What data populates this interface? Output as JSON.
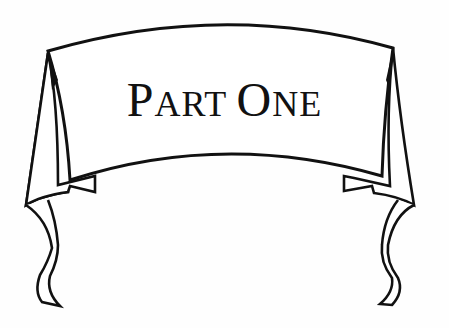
{
  "banner": {
    "title": "PART ONE",
    "title_parts": [
      {
        "text": "P",
        "size": "big"
      },
      {
        "text": "ART",
        "size": "small"
      },
      {
        "text": " ",
        "size": "small"
      },
      {
        "text": "O",
        "size": "big"
      },
      {
        "text": "NE",
        "size": "small"
      }
    ],
    "stroke_color": "#111111",
    "fill_color": "#ffffff"
  }
}
